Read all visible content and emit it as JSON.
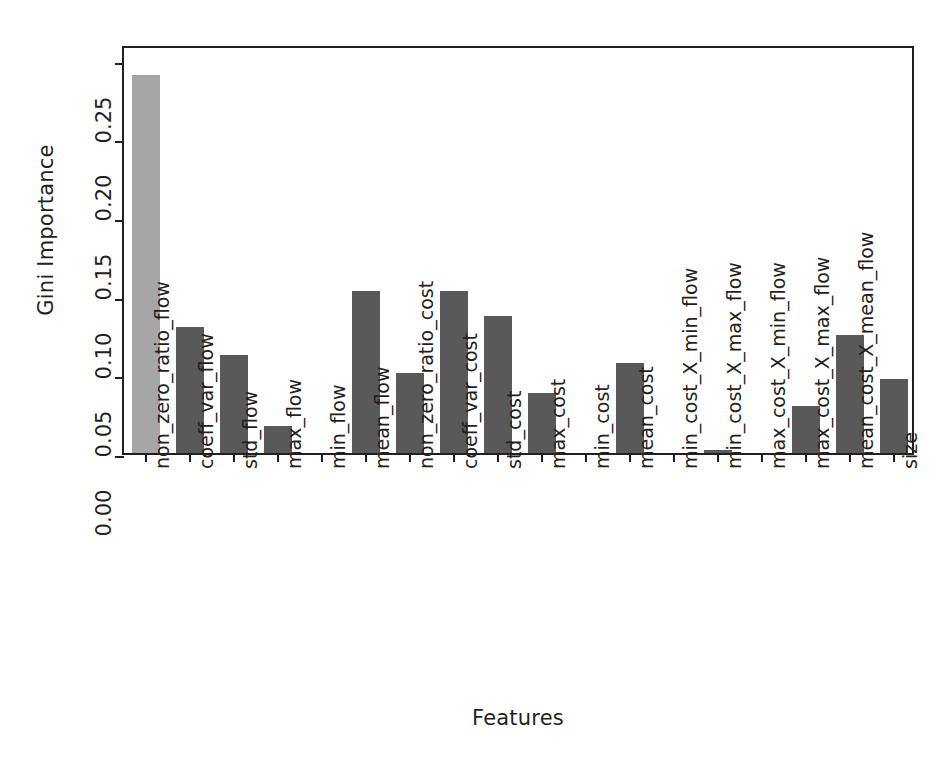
{
  "chart_data": {
    "type": "bar",
    "title": "",
    "xlabel": "Features",
    "ylabel": "Gini Importance",
    "ylim": [
      0.0,
      0.26
    ],
    "yticks": [
      0.0,
      0.05,
      0.1,
      0.15,
      0.2,
      0.25
    ],
    "ytick_labels": [
      "0.00",
      "0.05",
      "0.10",
      "0.15",
      "0.20",
      "0.25"
    ],
    "grid": false,
    "legend": "none",
    "categories": [
      "non_zero_ratio_flow",
      "coeff_var_flow",
      "std_flow",
      "max_flow",
      "min_flow",
      "mean_flow",
      "non_zero_ratio_cost",
      "coeff_var_cost",
      "std_cost",
      "max_cost",
      "min_cost",
      "mean_cost",
      "min_cost_X_min_flow",
      "min_cost_X_max_flow",
      "max_cost_X_min_flow",
      "max_cost_X_max_flow",
      "mean_cost_X_mean_flow",
      "size"
    ],
    "values": [
      0.24,
      0.08,
      0.062,
      0.017,
      0.0,
      0.103,
      0.051,
      0.103,
      0.087,
      0.038,
      0.0,
      0.057,
      0.0,
      0.002,
      0.0,
      0.03,
      0.075,
      0.047
    ],
    "bar_colors": [
      "#a6a6a6",
      "#595959",
      "#595959",
      "#595959",
      "#595959",
      "#595959",
      "#595959",
      "#595959",
      "#595959",
      "#595959",
      "#595959",
      "#595959",
      "#595959",
      "#595959",
      "#595959",
      "#595959",
      "#595959",
      "#595959"
    ],
    "highlight_color": "#a6a6a6",
    "default_color": "#595959",
    "axis_color": "#231f20"
  }
}
